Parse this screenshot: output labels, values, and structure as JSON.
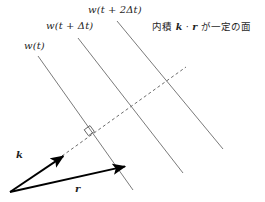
{
  "figure": {
    "background_color": "#ffffff",
    "line_color": "#6b6b6b",
    "vector_color": "#000000",
    "text_color": "#1f1f1f",
    "width": 265,
    "height": 202
  },
  "wavefronts": [
    {
      "id": "wavefront-1",
      "label": "w(t)",
      "label_parts": {
        "fn": "w",
        "open": "(",
        "arg": "t",
        "close": ")"
      },
      "x1": 38,
      "y1": 56,
      "x2": 133,
      "y2": 190
    },
    {
      "id": "wavefront-2",
      "label": "w(t + Δt)",
      "label_parts": {
        "fn": "w",
        "open": "(",
        "arg": "t + Δt",
        "close": ")"
      },
      "x1": 78,
      "y1": 38,
      "x2": 183,
      "y2": 173
    },
    {
      "id": "wavefront-3",
      "label": "w(t + 2Δt)",
      "label_parts": {
        "fn": "w",
        "open": "(",
        "arg": "t + 2Δt",
        "close": ")"
      },
      "x1": 117,
      "y1": 21,
      "x2": 223,
      "y2": 149
    }
  ],
  "annotation": {
    "id": "plane-annotation",
    "text": "内積 k · r が一定の面",
    "prefix": "内積",
    "vector_a": "k",
    "dot": "·",
    "vector_b": "r",
    "suffix": "が一定の面"
  },
  "normal_line": {
    "id": "normal-dashed-line",
    "style": "dashed",
    "x1": 62,
    "y1": 156,
    "x2": 186,
    "y2": 67,
    "dash_pattern": "3 2.6"
  },
  "right_angle_marker": {
    "id": "perpendicular-marker",
    "x": 89,
    "y": 131,
    "size": 8,
    "meaning": "90-degree"
  },
  "vectors": [
    {
      "id": "vector-k",
      "label": "k",
      "origin_x": 10,
      "origin_y": 192,
      "tip_x": 65,
      "tip_y": 155,
      "label_x": 16,
      "label_y": 150
    },
    {
      "id": "vector-r",
      "label": "r",
      "origin_x": 10,
      "origin_y": 192,
      "tip_x": 127,
      "tip_y": 166,
      "label_x": 75,
      "label_y": 184
    }
  ],
  "chart_data": {
    "type": "diagram",
    "elements": [
      {
        "kind": "line",
        "name": "w(t)",
        "from": [
          38,
          56
        ],
        "to": [
          133,
          190
        ]
      },
      {
        "kind": "line",
        "name": "w(t + Δt)",
        "from": [
          78,
          38
        ],
        "to": [
          183,
          173
        ]
      },
      {
        "kind": "line",
        "name": "w(t + 2Δt)",
        "from": [
          117,
          21
        ],
        "to": [
          223,
          149
        ]
      },
      {
        "kind": "dashed-line",
        "name": "normal direction",
        "from": [
          62,
          156
        ],
        "to": [
          186,
          67
        ]
      },
      {
        "kind": "arrow",
        "name": "k",
        "from": [
          10,
          192
        ],
        "to": [
          65,
          155
        ]
      },
      {
        "kind": "arrow",
        "name": "r",
        "from": [
          10,
          192
        ],
        "to": [
          127,
          166
        ]
      },
      {
        "kind": "angle-marker",
        "name": "right angle",
        "at": [
          89,
          131
        ],
        "degrees": 90
      }
    ]
  }
}
